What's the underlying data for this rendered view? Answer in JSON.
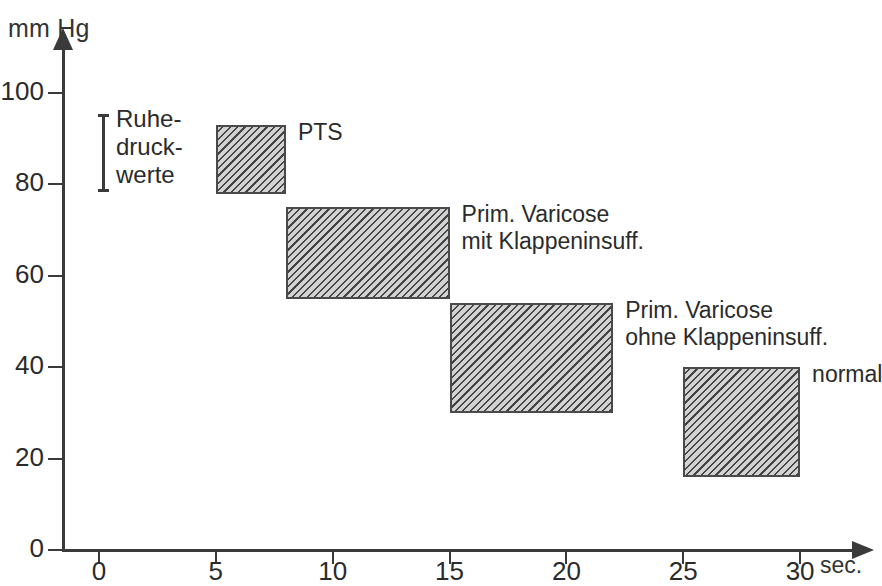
{
  "chart_data": {
    "type": "bar",
    "title": "",
    "xlabel": "sec.",
    "ylabel": "mm Hg",
    "xlim": [
      0,
      30
    ],
    "ylim": [
      0,
      110
    ],
    "grid": false,
    "legend": "inline-right-of-box",
    "x_ticks": [
      "0",
      "5",
      "10",
      "15",
      "20",
      "25",
      "30"
    ],
    "x_tick_values": [
      0,
      5,
      10,
      15,
      20,
      25,
      30
    ],
    "y_ticks": [
      "0",
      "20",
      "40",
      "60",
      "80",
      "100"
    ],
    "y_tick_values": [
      0,
      20,
      40,
      60,
      80,
      100
    ],
    "boxes": [
      {
        "label": "PTS",
        "x_start": 5,
        "x_end": 8,
        "y_low": 78,
        "y_high": 93
      },
      {
        "label": "Prim. Varicose\nmit Klappeninsuff.",
        "x_start": 8,
        "x_end": 15,
        "y_low": 55,
        "y_high": 75
      },
      {
        "label": "Prim. Varicose\nohne Klappeninsuff.",
        "x_start": 15,
        "x_end": 22,
        "y_low": 30,
        "y_high": 54
      },
      {
        "label": "normal",
        "x_start": 25,
        "x_end": 30,
        "y_low": 16,
        "y_high": 40
      }
    ],
    "annotations": [
      {
        "label": "Ruhe-\ndruck-\nwerte",
        "type": "range-bracket",
        "y_low": 80,
        "y_high": 94
      }
    ]
  },
  "axes": {
    "y_unit": "mm Hg",
    "x_unit": "sec."
  }
}
